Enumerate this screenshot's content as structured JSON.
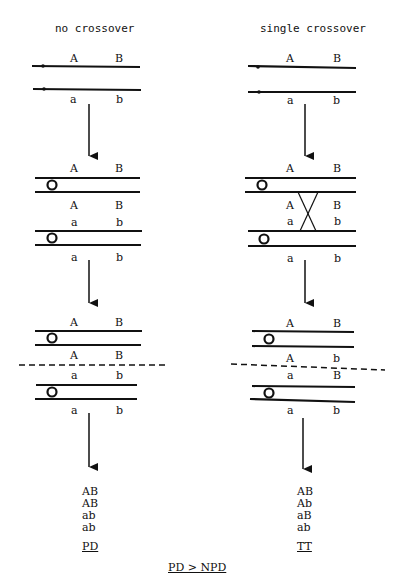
{
  "columns": [
    {
      "title": "no crossover",
      "stage1": {
        "top": [
          "A",
          "B"
        ],
        "bottom": [
          "a",
          "b"
        ]
      },
      "stage2": {
        "top_pair_upper": [
          "A",
          "B"
        ],
        "top_pair_lower": [
          "A",
          "B"
        ],
        "bottom_pair_upper": [
          "a",
          "b"
        ],
        "bottom_pair_lower": [
          "a",
          "b"
        ]
      },
      "stage3": {
        "top_pair_upper": [
          "A",
          "B"
        ],
        "top_pair_lower": [
          "A",
          "B"
        ],
        "bottom_pair_upper": [
          "a",
          "b"
        ],
        "bottom_pair_lower": [
          "a",
          "b"
        ]
      },
      "genotypes": [
        "AB",
        "AB",
        "ab",
        "ab"
      ],
      "result": "PD"
    },
    {
      "title": "single crossover",
      "stage1": {
        "top": [
          "A",
          "B"
        ],
        "bottom": [
          "a",
          "b"
        ]
      },
      "stage2": {
        "top_pair_upper": [
          "A",
          "B"
        ],
        "top_pair_lower": [
          "A",
          "B"
        ],
        "bottom_pair_upper": [
          "a",
          "b"
        ],
        "bottom_pair_lower": [
          "a",
          "b"
        ]
      },
      "stage3": {
        "top_pair_upper": [
          "A",
          "B"
        ],
        "top_pair_lower": [
          "A",
          "b"
        ],
        "bottom_pair_upper": [
          "a",
          "B"
        ],
        "bottom_pair_lower": [
          "a",
          "b"
        ]
      },
      "genotypes": [
        "AB",
        "Ab",
        "aB",
        "ab"
      ],
      "result": "TT"
    }
  ],
  "footer": "PD > NPD",
  "colors": {
    "ink": "#111111",
    "background": "#ffffff"
  }
}
